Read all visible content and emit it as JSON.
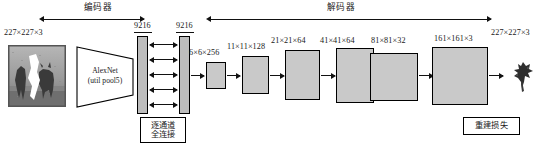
{
  "figure": {
    "type": "neural-network-architecture-diagram",
    "sections": {
      "encoder_label": "编码器",
      "decoder_label": "解码器"
    },
    "input": {
      "shape_label": "227×227×3",
      "icon": "masked-grayscale-photo"
    },
    "backbone": {
      "line1": "AlexNet",
      "line2": "(util pool5)"
    },
    "bottleneck": {
      "bar_left_label": "9216",
      "bar_right_label": "9216",
      "connector_label_line1": "逐通道",
      "connector_label_line2": "全连接",
      "arrow_count": 5
    },
    "decoder_blocks": [
      {
        "label": "6×6×256"
      },
      {
        "label": "11×11×128"
      },
      {
        "label": "21×21×64"
      },
      {
        "label": "41×41×64"
      },
      {
        "label": "81×81×32"
      },
      {
        "label": "161×161×3"
      }
    ],
    "output": {
      "shape_label": "227×227×3",
      "icon": "reconstructed-patch-thumbnail"
    },
    "loss": {
      "label_line1": "重建损失"
    },
    "colors": {
      "block_fill": "#c9c9c9",
      "bar_fill": "#bdbdbd",
      "stroke": "#000000",
      "background": "#ffffff",
      "text": "#1a1a1a"
    }
  }
}
